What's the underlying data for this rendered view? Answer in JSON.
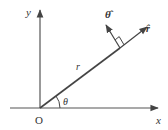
{
  "diagram": {
    "type": "polar-coordinate-unit-vectors",
    "labels": {
      "x_axis": "x",
      "y_axis": "y",
      "origin": "O",
      "radius": "r",
      "angle": "θ",
      "r_hat": "r̂",
      "theta_hat": "θ̂"
    },
    "colors": {
      "line": "#444444",
      "text": "#333333",
      "background": "#ffffff"
    }
  }
}
